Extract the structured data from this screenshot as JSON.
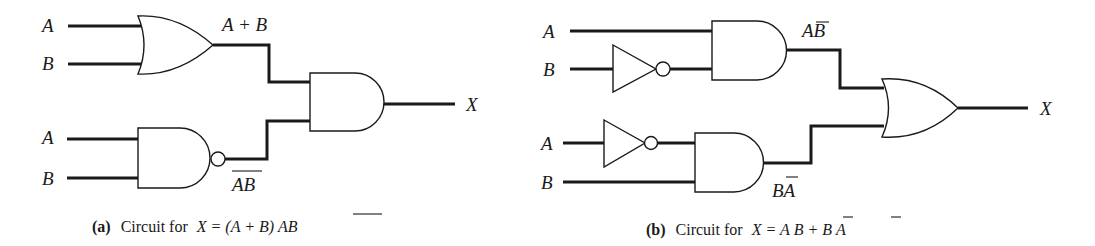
{
  "figure": {
    "circuit_a": {
      "inputs": {
        "or_gate": [
          "A",
          "B"
        ],
        "nand_gate": [
          "A",
          "B"
        ]
      },
      "gates": [
        {
          "type": "OR",
          "inputs": [
            "A",
            "B"
          ],
          "output_label": "A + B"
        },
        {
          "type": "NAND",
          "inputs": [
            "A",
            "B"
          ],
          "output_label_base": "AB",
          "output_overbar": "AB"
        },
        {
          "type": "AND",
          "inputs": [
            "A + B",
            "NOT(AB)"
          ],
          "output_label": "X"
        }
      ],
      "labels": {
        "in_a_top": "A",
        "in_b_top": "B",
        "in_a_bottom": "A",
        "in_b_bottom": "B",
        "or_out": "A + B",
        "nand_out": "AB",
        "output": "X"
      },
      "caption": {
        "tag": "(a)",
        "text": "Circuit for",
        "expr_prefix": "X = (A + B)",
        "expr_overbar": "AB"
      }
    },
    "circuit_b": {
      "gates": [
        {
          "type": "NOT",
          "input": "B"
        },
        {
          "type": "AND",
          "inputs": [
            "A",
            "NOT B"
          ],
          "output_label": "AB̄"
        },
        {
          "type": "NOT",
          "input": "A"
        },
        {
          "type": "AND",
          "inputs": [
            "NOT A",
            "B"
          ],
          "output_label": "BĀ"
        },
        {
          "type": "OR",
          "inputs": [
            "AB̄",
            "BĀ"
          ],
          "output_label": "X"
        }
      ],
      "labels": {
        "in_a_top": "A",
        "in_b_top": "B",
        "in_a_bottom": "A",
        "in_b_bottom": "B",
        "and_top_out_plain": "A",
        "and_top_out_bar": "B",
        "and_bottom_out_plain": "B",
        "and_bottom_out_bar": "A",
        "output": "X"
      },
      "caption": {
        "tag": "(b)",
        "text": "Circuit for",
        "expr_x": "X = A",
        "expr_bar1": "B",
        "expr_plus": " + B",
        "expr_bar2": "A"
      }
    }
  }
}
